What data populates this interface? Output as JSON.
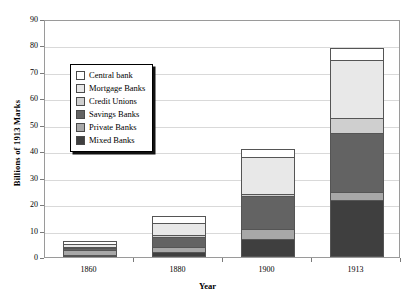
{
  "chart_data": {
    "type": "bar",
    "subtype": "stacked-bar",
    "title": "",
    "xlabel": "Year",
    "ylabel": "Billions of 1913 Marks",
    "categories": [
      "1860",
      "1880",
      "1900",
      "1913"
    ],
    "ylim": [
      0,
      90
    ],
    "yticks": [
      0,
      10,
      20,
      30,
      40,
      50,
      60,
      70,
      80,
      90
    ],
    "grid": true,
    "legend_position": "upper-left-inside",
    "series": [
      {
        "name": "Mixed Banks",
        "color": "#3f3f3f",
        "values": [
          0.4,
          2.0,
          7.0,
          21.5
        ]
      },
      {
        "name": "Private Banks",
        "color": "#a8a8a8",
        "values": [
          1.8,
          1.7,
          3.5,
          3.0
        ]
      },
      {
        "name": "Savings Banks",
        "color": "#636363",
        "values": [
          0.8,
          4.0,
          12.5,
          22.5
        ]
      },
      {
        "name": "Credit Unions",
        "color": "#cfcfcf",
        "values": [
          0.3,
          0.8,
          1.0,
          5.5
        ]
      },
      {
        "name": "Mortgage Banks",
        "color": "#e8e8e8",
        "values": [
          1.2,
          4.5,
          14.0,
          22.0
        ]
      },
      {
        "name": "Central bank",
        "color": "#ffffff",
        "values": [
          1.0,
          2.5,
          3.0,
          4.5
        ]
      }
    ],
    "totals": [
      5.5,
      15.5,
      41.0,
      79.0
    ]
  },
  "legend": {
    "items": [
      {
        "label": "Central bank",
        "swatch": "#ffffff"
      },
      {
        "label": "Mortgage Banks",
        "swatch": "#e8e8e8"
      },
      {
        "label": "Credit Unions",
        "swatch": "#cfcfcf"
      },
      {
        "label": "Savings Banks",
        "swatch": "#636363"
      },
      {
        "label": "Private Banks",
        "swatch": "#a8a8a8"
      },
      {
        "label": "Mixed Banks",
        "swatch": "#3f3f3f"
      }
    ]
  }
}
